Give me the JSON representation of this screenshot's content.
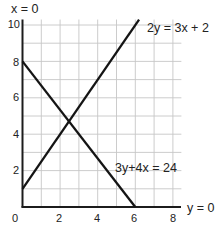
{
  "chart_data": {
    "type": "line",
    "title": "",
    "xlabel": "y = 0",
    "ylabel": "x = 0",
    "xlim": [
      0,
      8
    ],
    "ylim": [
      0,
      10
    ],
    "grid": true,
    "grid_step": 1,
    "x_ticks": [
      0,
      2,
      4,
      6,
      8
    ],
    "y_ticks": [
      2,
      4,
      6,
      8,
      10
    ],
    "x_tick_labels": [
      "0",
      "2",
      "4",
      "6",
      "8"
    ],
    "y_tick_labels": [
      "2",
      "4",
      "6",
      "8",
      "10"
    ],
    "legend": "none (lines labelled directly)",
    "series": [
      {
        "name": "2y = 3x + 2",
        "x": [
          0,
          6.2
        ],
        "y": [
          1,
          10.3
        ],
        "color": "#141414"
      },
      {
        "name": "3y+4x = 24",
        "x": [
          0,
          6
        ],
        "y": [
          8,
          0
        ],
        "color": "#141414"
      }
    ],
    "annotations": [
      {
        "text": "x = 0",
        "target": "vertical axis"
      },
      {
        "text": "y = 0",
        "target": "horizontal axis"
      },
      {
        "text": "2y = 3x + 2",
        "target": "rising line"
      },
      {
        "text": "3y+4x = 24",
        "target": "falling line"
      }
    ],
    "intersection": {
      "x": 2.47,
      "y": 4.71
    }
  },
  "labels": {
    "y_axis_equation": "x = 0",
    "x_axis_equation": "y = 0",
    "line1_equation": "2y = 3x + 2",
    "line2_equation": "3y+4x = 24"
  },
  "colors": {
    "line": "#141414",
    "grid": "#c6c6c6",
    "text": "#222222"
  }
}
